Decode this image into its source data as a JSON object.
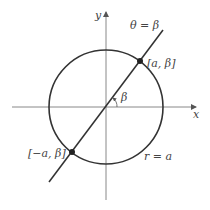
{
  "diagram": {
    "colors": {
      "axis": "#888888",
      "curve": "#333333",
      "text": "#444444",
      "background": "#ffffff"
    },
    "axes": {
      "x_label": "x",
      "y_label": "y"
    },
    "labels": {
      "line": "θ = β",
      "circle": "r = a",
      "angle": "β",
      "point_positive": "[a, β]",
      "point_negative": "[−a, β]"
    },
    "elements": [
      {
        "type": "axis",
        "name": "x-axis"
      },
      {
        "type": "axis",
        "name": "y-axis"
      },
      {
        "type": "circle",
        "name": "circle r = a"
      },
      {
        "type": "line",
        "name": "ray θ = β"
      },
      {
        "type": "point",
        "name": "[a, β]"
      },
      {
        "type": "point",
        "name": "[−a, β]"
      },
      {
        "type": "angle-arc",
        "name": "β"
      }
    ]
  }
}
